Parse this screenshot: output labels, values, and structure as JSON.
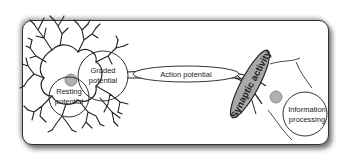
{
  "diagram": {
    "type": "neuron-signaling-overview",
    "nodes": [
      {
        "id": "graded",
        "lines": [
          "Graded",
          "potential"
        ]
      },
      {
        "id": "resting",
        "lines": [
          "Resting",
          "potential"
        ]
      },
      {
        "id": "action",
        "label": "Action potential"
      },
      {
        "id": "synaptic",
        "label": "Synaptic activity"
      },
      {
        "id": "info",
        "lines": [
          "Information",
          "processing"
        ]
      }
    ],
    "flow": [
      "Resting potential",
      "Graded potential",
      "Action potential",
      "Synaptic activity",
      "Information processing"
    ],
    "colors": {
      "outline": "#333333",
      "synaptic_fill": "#a8a8a8",
      "nucleus_fill": "#b0b0b0",
      "frame_shadow": "#555555"
    }
  }
}
